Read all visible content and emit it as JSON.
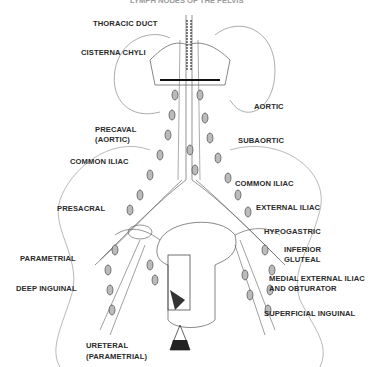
{
  "figure": {
    "title_partial": "LYMPH NODES OF THE PELVIS",
    "labels": {
      "thoracic_duct": "THORACIC DUCT",
      "cisterna_chyli": "CISTERNA CHYLI",
      "aortic": "AORTIC",
      "precaval_line1": "PRECAVAL",
      "precaval_line2": "(AORTIC)",
      "subaortic": "SUBAORTIC",
      "common_iliac_left": "COMMON ILIAC",
      "common_iliac_right": "COMMON ILIAC",
      "presacral": "PRESACRAL",
      "external_iliac": "EXTERNAL ILIAC",
      "hypogastric": "HYPOGASTRIC",
      "inferior_gluteal_line1": "INFERIOR",
      "inferior_gluteal_line2": "GLUTEAL",
      "parametrial": "PARAMETRIAL",
      "medial_external_iliac_line1": "MEDIAL EXTERNAL ILIAC",
      "medial_external_iliac_line2": "AND OBTURATOR",
      "deep_inguinal": "DEEP INGUINAL",
      "superficial_inguinal": "SUPERFICIAL INGUINAL",
      "ureteral_line1": "URETERAL",
      "ureteral_line2": "(PARAMETRIAL)"
    },
    "colors": {
      "line": "#555555",
      "text": "#2a2a2a",
      "background": "#ffffff"
    }
  }
}
